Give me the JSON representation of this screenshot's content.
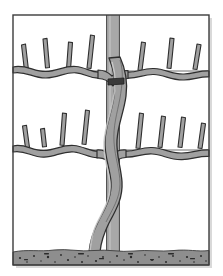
{
  "figure": {
    "title": "Espalier-trained tree on post with horizontal support wires",
    "style": "grayscale-line-illustration",
    "dimensions": {
      "width": 223,
      "height": 276
    }
  },
  "colors": {
    "background": "#ffffff",
    "frame_border": "#3c3c3c",
    "frame_shadow": "#b9b9b9",
    "wood_fill": "#a0a0a0",
    "wood_fill_light": "#b4b4b4",
    "wood_outline": "#2e2e2e",
    "post_fill": "#a8a8a8",
    "post_outline": "#4a4a4a",
    "wire_line": "#6e6e6e",
    "soil_fill": "#8e8e8e",
    "soil_speck": "#2b2b2b",
    "tie_band": "#2e2e2e"
  },
  "frame": {
    "name": "illustration-frame",
    "x": 13,
    "y": 15,
    "width": 196,
    "height": 250,
    "stroke_width": 1.4
  },
  "post": {
    "name": "vertical-support-post",
    "label": "support post",
    "x": 106,
    "width": 14,
    "top": 15,
    "bottom": 252
  },
  "wires": [
    {
      "name": "support-wire-upper",
      "label": "upper wire",
      "y": 71,
      "x1": 13,
      "x2": 209
    },
    {
      "name": "support-wire-lower",
      "label": "lower wire",
      "y": 150,
      "x1": 13,
      "x2": 209
    }
  ],
  "soil": {
    "name": "soil-band",
    "label": "ground / soil",
    "y": 249,
    "height": 16,
    "x1": 13,
    "x2": 209,
    "speck_count": 46
  },
  "trunk": {
    "name": "main-trunk",
    "label": "sinuous central trunk",
    "base_x": 92,
    "top_y": 58,
    "bottom_y": 252,
    "tie_band": {
      "name": "trunk-tie-band",
      "y": 80,
      "label": "tie band"
    }
  },
  "tiers": [
    {
      "name": "cordon-tier-upper",
      "label": "upper cordon tier",
      "y": 71,
      "arms": [
        {
          "name": "cordon-arm-upper-left",
          "side": "left",
          "spur_count": 4,
          "spurs": [
            {
              "name": "spur",
              "x": 26,
              "height": 26,
              "lean": -5
            },
            {
              "name": "spur",
              "x": 47,
              "height": 29,
              "lean": -3
            },
            {
              "name": "spur",
              "x": 68,
              "height": 27,
              "lean": 3
            },
            {
              "name": "spur",
              "x": 89,
              "height": 33,
              "lean": 4
            }
          ]
        },
        {
          "name": "cordon-arm-upper-right",
          "side": "right",
          "spur_count": 3,
          "spurs": [
            {
              "name": "spur",
              "x": 140,
              "height": 28,
              "lean": 4
            },
            {
              "name": "spur",
              "x": 169,
              "height": 30,
              "lean": 3
            },
            {
              "name": "spur",
              "x": 195,
              "height": 25,
              "lean": 5
            }
          ]
        }
      ]
    },
    {
      "name": "cordon-tier-lower",
      "label": "lower cordon tier",
      "y": 150,
      "arms": [
        {
          "name": "cordon-arm-lower-left",
          "side": "left",
          "spur_count": 4,
          "spurs": [
            {
              "name": "spur",
              "x": 27,
              "height": 22,
              "lean": -4
            },
            {
              "name": "spur",
              "x": 44,
              "height": 18,
              "lean": -2
            },
            {
              "name": "spur",
              "x": 62,
              "height": 32,
              "lean": 2
            },
            {
              "name": "spur",
              "x": 84,
              "height": 34,
              "lean": 4
            }
          ]
        },
        {
          "name": "cordon-arm-lower-right",
          "side": "right",
          "spur_count": 4,
          "spurs": [
            {
              "name": "spur",
              "x": 138,
              "height": 33,
              "lean": 5
            },
            {
              "name": "spur",
              "x": 160,
              "height": 30,
              "lean": 4
            },
            {
              "name": "spur",
              "x": 180,
              "height": 29,
              "lean": 4
            },
            {
              "name": "spur",
              "x": 200,
              "height": 24,
              "lean": 5
            }
          ]
        }
      ]
    }
  ]
}
